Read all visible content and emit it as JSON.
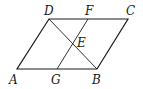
{
  "diagram": {
    "type": "geometry",
    "shape": "parallelogram ABCD",
    "points": {
      "A": {
        "label": "A",
        "x": 17,
        "y": 69
      },
      "B": {
        "label": "B",
        "x": 97,
        "y": 69
      },
      "C": {
        "label": "C",
        "x": 128,
        "y": 19
      },
      "D": {
        "label": "D",
        "x": 49,
        "y": 19
      },
      "E": {
        "label": "E",
        "x": 73,
        "y": 44
      },
      "F": {
        "label": "F",
        "x": 88,
        "y": 19
      },
      "G": {
        "label": "G",
        "x": 57,
        "y": 69
      }
    },
    "segments": [
      "AB",
      "BC",
      "CD",
      "DA",
      "DB",
      "FG"
    ]
  }
}
